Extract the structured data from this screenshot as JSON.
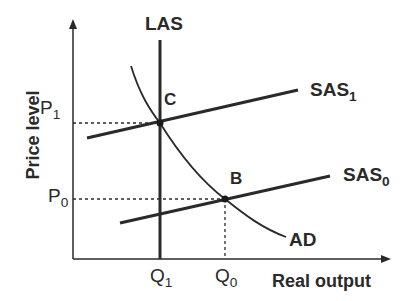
{
  "diagram": {
    "type": "AD-AS model",
    "axes": {
      "x_label": "Real output",
      "y_label": "Price level"
    },
    "curves": {
      "las": "LAS",
      "sas1_main": "SAS",
      "sas1_sub": "1",
      "sas0_main": "SAS",
      "sas0_sub": "0",
      "ad": "AD"
    },
    "points": {
      "c": "C",
      "b": "B"
    },
    "ticks": {
      "p1_main": "P",
      "p1_sub": "1",
      "p0_main": "P",
      "p0_sub": "0",
      "q1_main": "Q",
      "q1_sub": "1",
      "q0_main": "Q",
      "q0_sub": "0"
    },
    "colors": {
      "line": "#2a2a2a",
      "background": "#ffffff"
    }
  }
}
